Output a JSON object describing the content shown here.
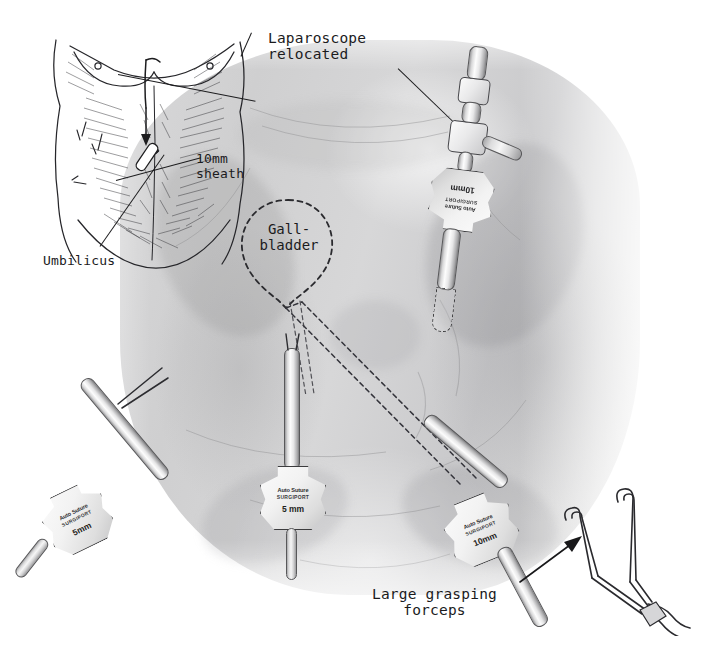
{
  "figure": {
    "medium": "pencil and pen-and-ink medical illustration",
    "background_color": "#ffffff",
    "ink_color": "#1b1b1d"
  },
  "labels": {
    "laparoscope_relocated": "Laparoscope\nrelocated",
    "sheath_10mm": "10mm\nsheath",
    "umbilicus": "Umbilicus",
    "gallbladder": "Gall-\nbladder",
    "large_grasping_forceps": "Large grasping\nforceps"
  },
  "inset": {
    "name": "anterior-torso-orientation-diagram",
    "description": "pen-and-ink anterior torso showing relocation of laparoscope from epigastric to infra-umbilical site",
    "arrow_direction": "downward"
  },
  "trocars": [
    {
      "id": "upper-right-trocar",
      "position": "upper right, subcostal",
      "size": "10mm",
      "brand": "Auto Suture",
      "brand_mark": "®",
      "model": "SURGIPORT",
      "model_mark": "™",
      "orientation": "inverted",
      "holds": "laparoscope"
    },
    {
      "id": "left-lateral-trocar",
      "position": "lower left, lateral",
      "size": "5mm",
      "brand": "Auto Suture",
      "brand_mark": "®",
      "model": "SURGIPORT",
      "model_mark": "™",
      "orientation": "oblique",
      "holds": "grasper"
    },
    {
      "id": "midline-trocar",
      "position": "lower midline",
      "size": "5 mm",
      "brand": "Auto Suture",
      "brand_mark": "®",
      "model": "SURGIPORT",
      "model_mark": "™",
      "orientation": "vertical",
      "holds": "dissector"
    },
    {
      "id": "lower-right-trocar",
      "position": "lower right",
      "size": "10mm",
      "brand": "Auto Suture",
      "brand_mark": "®",
      "model": "SURGIPORT",
      "model_mark": "™",
      "orientation": "oblique",
      "holds": "large grasping forceps"
    }
  ],
  "instruments": [
    {
      "id": "large-grasping-forceps",
      "name": "Large grasping forceps",
      "jaws": 2,
      "jaw_shape": "curved hook"
    }
  ],
  "annotations": {
    "arrow_to_forceps": "arrow pointing from caption to forceps instrument",
    "dashed_outline": "dashed line indicates structures beneath the abdominal wall"
  }
}
